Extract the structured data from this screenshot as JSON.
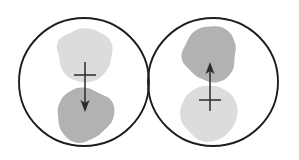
{
  "figure": {
    "title": "",
    "background_color": "#ffffff",
    "width": 299,
    "height": 160,
    "colors": {
      "outline": "#1d1d1d",
      "blob_light": "#dcdcdc",
      "blob_dark": "#b2b2b2",
      "arrow": "#2a2a2a"
    },
    "panels": [
      {
        "id": "left-cell",
        "name": "left-cell",
        "label": "",
        "circle": {
          "cx": 84,
          "cy": 82,
          "rx": 65,
          "ry": 64
        },
        "blobs": [
          {
            "id": "left-top-blob",
            "name": "light-blob",
            "position": "top",
            "shade": "light",
            "color": "#dcdcdc",
            "cx": 85,
            "cy": 54,
            "r": 28
          },
          {
            "id": "left-bottom-blob",
            "name": "dark-blob",
            "position": "bottom",
            "shade": "dark",
            "color": "#b2b2b2",
            "cx": 85,
            "cy": 114,
            "r": 28
          }
        ],
        "arrow": {
          "direction": "down",
          "x": 85,
          "y_start": 62,
          "y_end": 112,
          "tick_y": 75,
          "tick_half_width": 11
        }
      },
      {
        "id": "right-cell",
        "name": "right-cell",
        "label": "",
        "circle": {
          "cx": 213,
          "cy": 82,
          "rx": 65,
          "ry": 64
        },
        "blobs": [
          {
            "id": "right-top-blob",
            "name": "dark-blob",
            "position": "top",
            "shade": "dark",
            "color": "#b2b2b2",
            "cx": 210,
            "cy": 54,
            "r": 28
          },
          {
            "id": "right-bottom-blob",
            "name": "light-blob",
            "position": "bottom",
            "shade": "light",
            "color": "#dcdcdc",
            "cx": 210,
            "cy": 114,
            "r": 28
          }
        ],
        "arrow": {
          "direction": "up",
          "x": 210,
          "y_start": 111,
          "y_end": 62,
          "tick_y": 100,
          "tick_half_width": 11
        }
      }
    ]
  }
}
